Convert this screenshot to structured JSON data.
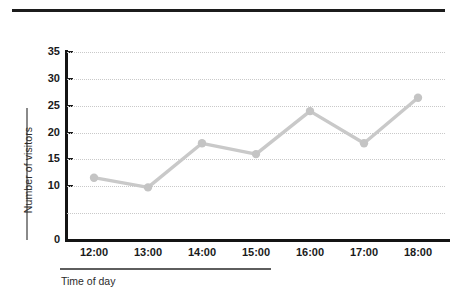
{
  "chart_data": {
    "type": "line",
    "title": "",
    "xlabel": "Time of day",
    "ylabel": "Number of visitors",
    "categories": [
      "12:00",
      "13:00",
      "14:00",
      "15:00",
      "16:00",
      "17:00",
      "18:00"
    ],
    "values": [
      11.6,
      9.8,
      18,
      16,
      24,
      18,
      26.5
    ],
    "series": [
      {
        "name": "Number of visitors",
        "values": [
          11.6,
          9.8,
          18,
          16,
          24,
          18,
          26.5
        ]
      }
    ],
    "ylim": [
      0,
      35
    ],
    "ytick_labels": [
      "35",
      "30",
      "25",
      "20",
      "15",
      "10",
      "0"
    ],
    "ytick_values": [
      35,
      30,
      25,
      20,
      15,
      10,
      0
    ],
    "xtick_labels": [
      "12:00",
      "13:00",
      "14:00",
      "15:00",
      "16:00",
      "17:00",
      "18:00"
    ],
    "grid": "horizontal-dotted",
    "legend": "none",
    "line_color": "#c9c9c9",
    "marker_color": "#c4c4c4",
    "axis_color": "#141414",
    "grid_color": "#c9c9c9",
    "top_rule_color": "#1c1c1c"
  },
  "axes": {
    "y_title": "Number of visitors",
    "x_title": "Time of day"
  }
}
